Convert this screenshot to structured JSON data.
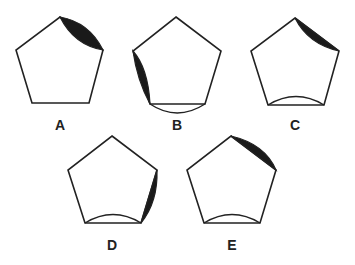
{
  "figure": {
    "stroke_color": "#222222",
    "fill_color": "#1a1a1a",
    "options": [
      {
        "label": "A",
        "features": [
          "black lens on top-right edge (top to upper-right vertex)"
        ]
      },
      {
        "label": "B",
        "features": [
          "black lens on upper-left side edge",
          "outward bulging arc on bottom edge"
        ]
      },
      {
        "label": "C",
        "features": [
          "black concave segment on top-right edge",
          "inward bulging arc on bottom edge"
        ]
      },
      {
        "label": "D",
        "features": [
          "black segment on lower-right side edge",
          "inward bulging arc on bottom edge"
        ]
      },
      {
        "label": "E",
        "features": [
          "black convex segment on top-right edge",
          "inward bulging arc on bottom edge"
        ]
      }
    ]
  }
}
